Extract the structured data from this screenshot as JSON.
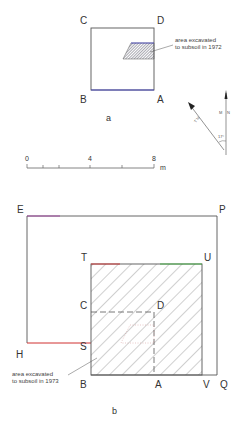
{
  "figure_a": {
    "caption": "a",
    "corners": {
      "C": "C",
      "D": "D",
      "B": "B",
      "A": "A"
    },
    "annotation": [
      "area excavated",
      "to subsoil in 1972"
    ]
  },
  "north_arrow": {
    "magnetic": "M",
    "north": "N",
    "true_label": "T N",
    "angle": "17°"
  },
  "scale_bar": {
    "ticks": [
      "0",
      "4",
      "8"
    ],
    "unit": "m"
  },
  "figure_b": {
    "caption": "b",
    "corners": {
      "E": "E",
      "P": "P",
      "T": "T",
      "U": "U",
      "C": "C",
      "D": "D",
      "H": "H",
      "S": "S",
      "B": "B",
      "A": "A",
      "V": "V",
      "Q": "Q"
    },
    "annotation": [
      "area excavated",
      "to subsoil in 1973"
    ]
  },
  "colors": {
    "line": "#555555",
    "red_edge": "#d03030",
    "green_edge": "#40b040",
    "blue_edge": "#4040c0",
    "purple_edge": "#a040a0"
  }
}
